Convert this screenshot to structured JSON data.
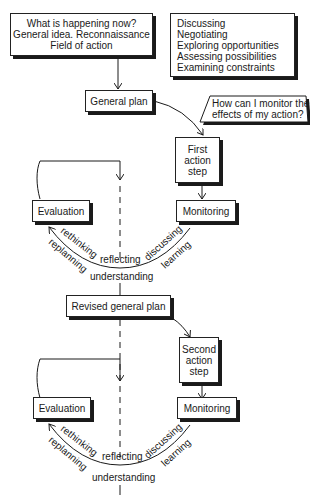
{
  "diagram": {
    "top_left_box": {
      "lines": [
        "What is happening now?",
        "General idea. Reconnaissance",
        "Field of action"
      ]
    },
    "top_right_box": {
      "lines": [
        "Discussing",
        "Negotiating",
        "Exploring opportunities",
        "Assessing possibilities",
        "Examining constraints"
      ]
    },
    "general_plan": "General plan",
    "question": {
      "lines": [
        "How can I monitor the",
        "effects of my action?"
      ]
    },
    "cycle1": {
      "action_step": [
        "First",
        "action",
        "step"
      ],
      "evaluation": "Evaluation",
      "monitoring": "Monitoring",
      "arc_labels": {
        "rethinking": "rethinking",
        "replanning": "replanning",
        "reflecting": "reflecting",
        "discussing": "discussing",
        "learning": "learning",
        "understanding": "understanding"
      }
    },
    "revised_plan": "Revised general plan",
    "cycle2": {
      "action_step": [
        "Second",
        "action",
        "step"
      ],
      "evaluation": "Evaluation",
      "monitoring": "Monitoring",
      "arc_labels": {
        "rethinking": "rethinking",
        "replanning": "replanning",
        "reflecting": "reflecting",
        "discussing": "discussing",
        "learning": "learning",
        "understanding": "understanding"
      }
    }
  }
}
